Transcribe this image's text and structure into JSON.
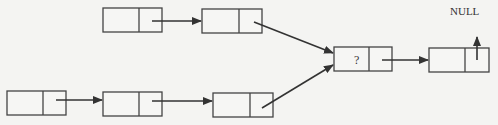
{
  "diagram": {
    "type": "linked-list-merge",
    "null_label": "NULL",
    "unknown_label": "?",
    "nodes": [
      {
        "id": "top1",
        "row": "top",
        "x": 103,
        "y": 8,
        "w": 59,
        "h": 24,
        "divider": 139,
        "label": ""
      },
      {
        "id": "top2",
        "row": "top",
        "x": 202,
        "y": 9,
        "w": 60,
        "h": 24,
        "divider": 239,
        "label": ""
      },
      {
        "id": "bot1",
        "row": "bottom",
        "x": 7,
        "y": 91,
        "w": 59,
        "h": 24,
        "divider": 43,
        "label": ""
      },
      {
        "id": "bot2",
        "row": "bottom",
        "x": 103,
        "y": 92,
        "w": 59,
        "h": 24,
        "divider": 139,
        "label": ""
      },
      {
        "id": "bot3",
        "row": "bottom",
        "x": 213,
        "y": 93,
        "w": 60,
        "h": 24,
        "divider": 250,
        "label": ""
      },
      {
        "id": "merge",
        "row": "middle",
        "x": 334,
        "y": 47,
        "w": 58,
        "h": 24,
        "divider": 369,
        "label": "?"
      },
      {
        "id": "tail",
        "row": "middle",
        "x": 429,
        "y": 48,
        "w": 60,
        "h": 24,
        "divider": 465,
        "label": ""
      }
    ],
    "edges": [
      {
        "from": "top1",
        "to": "top2"
      },
      {
        "from": "top2",
        "to": "merge"
      },
      {
        "from": "bot1",
        "to": "bot2"
      },
      {
        "from": "bot2",
        "to": "bot3"
      },
      {
        "from": "bot3",
        "to": "merge"
      },
      {
        "from": "merge",
        "to": "tail"
      },
      {
        "from": "tail",
        "to": "NULL"
      }
    ]
  }
}
